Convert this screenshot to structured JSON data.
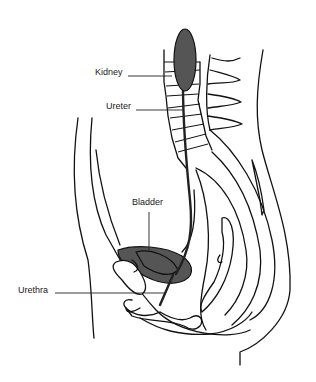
{
  "diagram": {
    "labels": [
      {
        "id": "kidney",
        "text": "Kidney"
      },
      {
        "id": "ureter",
        "text": "Ureter"
      },
      {
        "id": "bladder",
        "text": "Bladder"
      },
      {
        "id": "urethra",
        "text": "Urethra"
      }
    ],
    "colors": {
      "organ_fill": "#555555",
      "outline": "#111111",
      "background": "#ffffff"
    }
  }
}
